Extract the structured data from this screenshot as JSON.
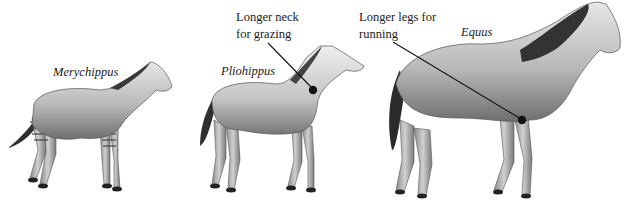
{
  "figure": {
    "type": "horse-evolution-illustration",
    "species": [
      {
        "name": "Merychippus",
        "position": "left"
      },
      {
        "name": "Pliohippus",
        "position": "middle"
      },
      {
        "name": "Equus",
        "position": "right"
      }
    ],
    "annotations": [
      {
        "line1": "Longer neck",
        "line2": "for grazing",
        "points_to": "Pliohippus neck"
      },
      {
        "line1": "Longer legs for",
        "line2": "running",
        "points_to": "Equus leg"
      }
    ],
    "colors": {
      "background": "#ffffff",
      "text": "#1a1a1a",
      "pointer": "#111111",
      "horse_dark": "#3a3a3a",
      "horse_mid": "#8a8a8a",
      "horse_light": "#d9d9d9"
    }
  }
}
